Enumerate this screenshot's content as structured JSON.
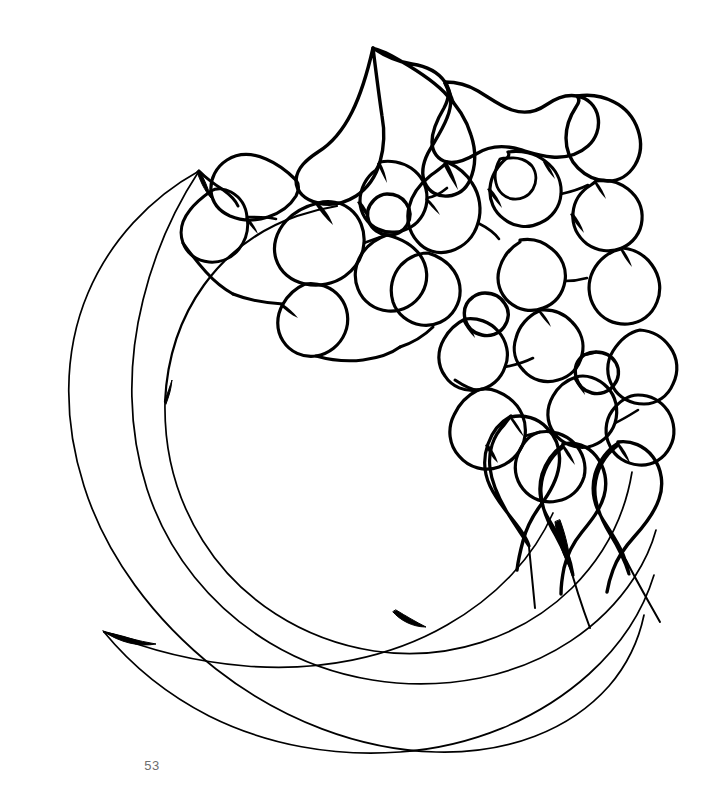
{
  "document": {
    "kind": "coloring-book-page",
    "page_number": "53",
    "background_color": "#ffffff",
    "ink_color": "#000000",
    "page_number_color": "#6e6e6e",
    "canvas": {
      "width": 714,
      "height": 811
    }
  },
  "artwork": {
    "title": "Floral crescent wreath",
    "description": "Black line-art outline drawing of a circular crescent ribbon wreath with a dense hydrangea-like flower cluster filling the upper-right quadrant and trailing into teardrop petals at the lower right.",
    "style": "uncolored black outline, variable-width ink strokes, white fill",
    "elements": [
      {
        "name": "outer-crescent-arc",
        "label": "Outer crescent band"
      },
      {
        "name": "middle-crescent-arc",
        "label": "Middle crescent band"
      },
      {
        "name": "inner-circle-arc",
        "label": "Inner circle edge"
      },
      {
        "name": "flower-cluster",
        "label": "Hydrangea flower cluster"
      },
      {
        "name": "flower-center-1",
        "label": "Small round flower center"
      },
      {
        "name": "flower-center-2",
        "label": "Small round flower center"
      },
      {
        "name": "flower-center-3",
        "label": "Small round flower center"
      },
      {
        "name": "teardrop-petals",
        "label": "Pendant teardrop petals"
      }
    ],
    "flower_center_count": 3,
    "petal_count_approx": 34
  },
  "footer": {
    "page_label": "53"
  }
}
